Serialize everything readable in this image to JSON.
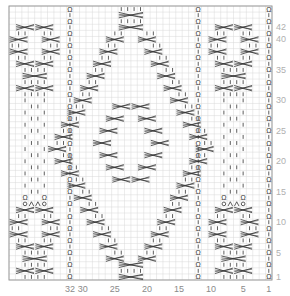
{
  "chart": {
    "grid": {
      "columns": 41,
      "rows": 45,
      "left": 9,
      "top": 6,
      "right": 272,
      "bottom": 280,
      "line_color": "#d9d9d9",
      "border_color": "#9a9a9a",
      "symbol_color": "#333333"
    },
    "column_labels": [
      {
        "col": 32,
        "text": "32"
      },
      {
        "col": 30,
        "text": "30"
      },
      {
        "col": 25,
        "text": "25"
      },
      {
        "col": 20,
        "text": "20"
      },
      {
        "col": 15,
        "text": "15"
      },
      {
        "col": 10,
        "text": "10"
      },
      {
        "col": 5,
        "text": "5"
      },
      {
        "col": 1,
        "text": "1"
      }
    ],
    "row_labels": [
      {
        "row": 1,
        "text": "1"
      },
      {
        "row": 5,
        "text": "5"
      },
      {
        "row": 10,
        "text": "10"
      },
      {
        "row": 15,
        "text": "15"
      },
      {
        "row": 20,
        "text": "20"
      },
      {
        "row": 25,
        "text": "25"
      },
      {
        "row": 30,
        "text": "30"
      },
      {
        "row": 35,
        "text": "35"
      },
      {
        "row": 40,
        "text": "40"
      },
      {
        "row": 42,
        "text": "42"
      }
    ],
    "twisted_columns": [
      1,
      12,
      32
    ],
    "legend": {
      "knit": "|",
      "twisted_knit": "Ω",
      "yarn_over": "O",
      "k2tog": "λ",
      "cable": "⋈"
    },
    "panels": [
      {
        "name": "left-panel",
        "center_col": 37.5
      },
      {
        "name": "center-panel",
        "center_col": 22
      },
      {
        "name": "right-panel",
        "center_col": 6.5
      }
    ]
  }
}
